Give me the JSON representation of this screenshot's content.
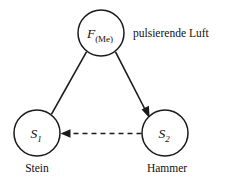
{
  "diagram": {
    "background_color": "#ffffff",
    "stroke_color": "#1a1a1a",
    "nodes": [
      {
        "id": "f-me",
        "symbol": "F",
        "subscript": "(Me)",
        "caption": "",
        "cx": 101,
        "cy": 33,
        "r": 23
      },
      {
        "id": "s1",
        "symbol": "S",
        "subscript": "1",
        "caption": "Stein",
        "cx": 37,
        "cy": 133,
        "r": 23
      },
      {
        "id": "s2",
        "symbol": "S",
        "subscript": "2",
        "caption": "Hammer",
        "cx": 165,
        "cy": 133,
        "r": 23
      }
    ],
    "edges": [
      {
        "id": "f-to-s1",
        "from": "f-me",
        "to": "s1",
        "style": "solid",
        "arrowhead": "none"
      },
      {
        "id": "f-to-s2",
        "from": "f-me",
        "to": "s2",
        "style": "solid",
        "arrowhead": "target"
      },
      {
        "id": "s2-to-s1",
        "from": "s2",
        "to": "s1",
        "style": "dashed",
        "arrowhead": "target"
      }
    ],
    "annotations": [
      {
        "id": "pulsierende-luft",
        "text": "pulsierende Luft",
        "x": 133,
        "y": 37
      }
    ]
  }
}
